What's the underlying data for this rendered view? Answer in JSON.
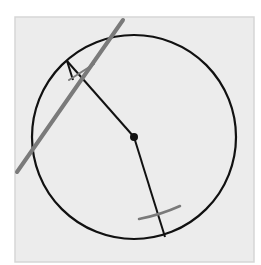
{
  "diagram": {
    "type": "geometric-construction",
    "colors": {
      "background": "#ffffff",
      "paper": "#ececec",
      "paper_edge": "#d6d6d6",
      "ink": "#111111",
      "pencil": "#7a7a7a"
    },
    "paper": {
      "x": 15,
      "y": 17,
      "width": 239,
      "height": 245
    },
    "circle": {
      "cx": 134,
      "cy": 137,
      "r": 102
    },
    "center_point": {
      "x": 134,
      "y": 137,
      "r": 4
    },
    "radius_upper": {
      "x1": 134,
      "y1": 137,
      "x2": 67,
      "y2": 61
    },
    "radius_lower": {
      "x1": 134,
      "y1": 137,
      "x2": 165,
      "y2": 237
    },
    "tangent_line": {
      "x1": 17,
      "y1": 172,
      "x2": 123,
      "y2": 20
    },
    "upper_tick": {
      "x1": 69,
      "y1": 80,
      "x2": 94,
      "y2": 64
    },
    "upper_perp_segment": {
      "x1": 67,
      "y1": 61,
      "x2": 73,
      "y2": 80
    },
    "lower_arc": {
      "d": "M 139 219 Q 160 215 180 206"
    }
  }
}
